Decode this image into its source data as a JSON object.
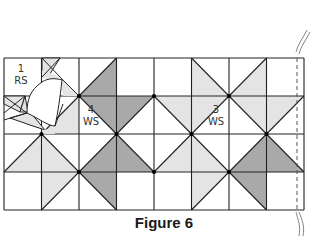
{
  "figure": {
    "caption": "Figure 6",
    "grid": {
      "cols": 8,
      "rows": 4,
      "x_lines": [
        4,
        41.5,
        79,
        116.5,
        154,
        191.5,
        229,
        266.5,
        304
      ],
      "y_lines": [
        58,
        96,
        134,
        172,
        210
      ]
    },
    "colors": {
      "dark": "#a9a9a9",
      "light": "#e4e4e4",
      "line": "#222222",
      "white": "#ffffff"
    },
    "cells": [
      {
        "c": 2,
        "r": 0,
        "diag": "/",
        "half": "LR",
        "shade": "dark"
      },
      {
        "c": 5,
        "r": 0,
        "diag": "\\",
        "half": "LL",
        "shade": "light"
      },
      {
        "c": 6,
        "r": 0,
        "diag": "/",
        "half": "LR",
        "shade": "light"
      },
      {
        "c": 1,
        "r": 1,
        "diag": "/",
        "half": "LR",
        "shade": "light"
      },
      {
        "c": 2,
        "r": 1,
        "diag": "\\",
        "half": "UR",
        "shade": "dark"
      },
      {
        "c": 3,
        "r": 1,
        "diag": "/",
        "half": "UL",
        "shade": "dark"
      },
      {
        "c": 4,
        "r": 1,
        "diag": "\\",
        "half": "UR",
        "shade": "light"
      },
      {
        "c": 5,
        "r": 1,
        "diag": "/",
        "half": "UL",
        "shade": "light"
      },
      {
        "c": 6,
        "r": 1,
        "diag": "\\",
        "half": "UR",
        "shade": "light"
      },
      {
        "c": 7,
        "r": 1,
        "diag": "/",
        "half": "UL",
        "shade": "light"
      },
      {
        "c": 0,
        "r": 2,
        "diag": "/",
        "half": "LR",
        "shade": "light"
      },
      {
        "c": 1,
        "r": 2,
        "diag": "\\",
        "half": "LL",
        "shade": "light"
      },
      {
        "c": 2,
        "r": 2,
        "diag": "/",
        "half": "LR",
        "shade": "dark"
      },
      {
        "c": 3,
        "r": 2,
        "diag": "\\",
        "half": "LL",
        "shade": "dark"
      },
      {
        "c": 4,
        "r": 2,
        "diag": "/",
        "half": "LR",
        "shade": "light"
      },
      {
        "c": 5,
        "r": 2,
        "diag": "\\",
        "half": "LL",
        "shade": "light"
      },
      {
        "c": 6,
        "r": 2,
        "diag": "/",
        "half": "LR",
        "shade": "dark"
      },
      {
        "c": 7,
        "r": 2,
        "diag": "\\",
        "half": "LL",
        "shade": "dark"
      },
      {
        "c": 1,
        "r": 3,
        "diag": "/",
        "half": "UL",
        "shade": "light"
      },
      {
        "c": 2,
        "r": 3,
        "diag": "\\",
        "half": "UR",
        "shade": "dark"
      },
      {
        "c": 5,
        "r": 3,
        "diag": "/",
        "half": "UL",
        "shade": "light"
      },
      {
        "c": 6,
        "r": 3,
        "diag": "\\",
        "half": "UR",
        "shade": "dark"
      }
    ],
    "vertex_dots": [
      [
        79,
        96
      ],
      [
        154,
        96
      ],
      [
        229,
        96
      ],
      [
        41.5,
        134
      ],
      [
        116.5,
        134
      ],
      [
        191.5,
        134
      ],
      [
        266.5,
        134
      ],
      [
        79,
        172
      ],
      [
        154,
        172
      ],
      [
        229,
        172
      ]
    ],
    "labels": [
      {
        "id": "block-1",
        "number": "1",
        "side": "RS",
        "x": 10,
        "y": 63
      },
      {
        "id": "block-4",
        "number": "4",
        "side": "WS",
        "x": 80,
        "y": 104
      },
      {
        "id": "block-3",
        "number": "3",
        "side": "WS",
        "x": 205,
        "y": 104
      }
    ],
    "seam_line": {
      "x": 297,
      "style": "dashed"
    }
  }
}
